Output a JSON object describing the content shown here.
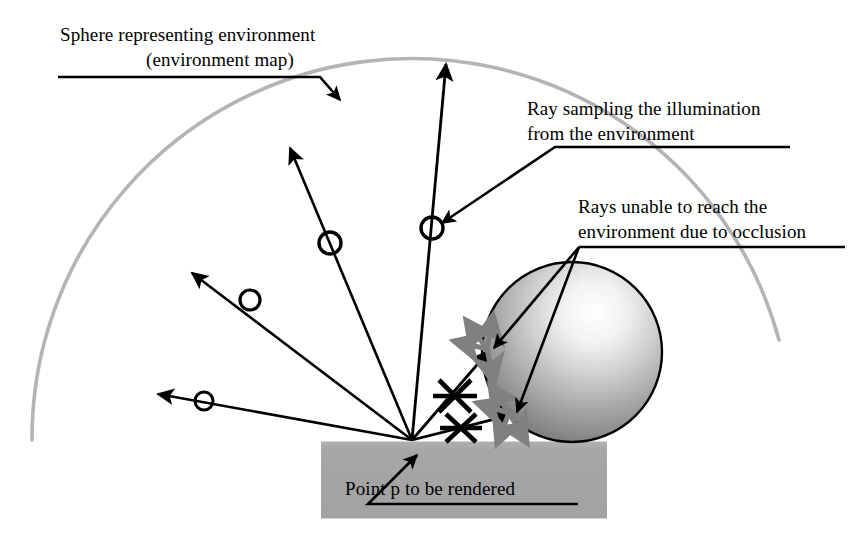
{
  "figure": {
    "background_color": "#ffffff"
  },
  "labels": {
    "sphere_env_line1": "Sphere representing environment",
    "sphere_env_line2": "(environment map)",
    "ray_sampling_line1": "Ray sampling the illumination",
    "ray_sampling_line2": "from the environment",
    "occlusion_line1": "Rays unable to reach the",
    "occlusion_line2": "environment due to occlusion",
    "point_p_prefix": "Point ",
    "point_p_symbol": "p",
    "point_p_suffix": " to be rendered"
  },
  "colors": {
    "ink": "#000000",
    "environment_arc": "#b0b0b0",
    "ground": "#a8a8a8",
    "ground_edge": "#9a9a9a",
    "occluded_arrow": "#808080",
    "sphere_highlight": "#ffffff",
    "sphere_mid": "#b8b8b8",
    "sphere_dark": "#6e6e6e",
    "sphere_outline": "#000000"
  },
  "geometry": {
    "origin_point": {
      "x": 412,
      "y": 440
    },
    "environment_arc": {
      "center_x": 412,
      "center_y": 440,
      "radius": 380,
      "start_angle_deg": 180,
      "end_angle_deg": 15,
      "stroke_width": 3.5
    },
    "occluder_sphere": {
      "cx": 572,
      "cy": 352,
      "r": 90
    },
    "ground": {
      "x": 321,
      "y": 441,
      "width": 286,
      "height": 77
    }
  },
  "sampling_rays": [
    {
      "name": "ray-left-horizontal",
      "tip_x": 152,
      "tip_y": 393,
      "marker_x": 204,
      "marker_y": 401,
      "marker_radius": 9
    },
    {
      "name": "ray-upper-left",
      "tip_x": 186,
      "tip_y": 268,
      "marker_x": 250,
      "marker_y": 300,
      "marker_radius": 10
    },
    {
      "name": "ray-mid-left",
      "tip_x": 286,
      "tip_y": 142,
      "marker_x": 330,
      "marker_y": 243,
      "marker_radius": 11
    },
    {
      "name": "ray-vertical",
      "tip_x": 446,
      "tip_y": 58,
      "marker_x": 432,
      "marker_y": 228,
      "marker_radius": 11
    }
  ],
  "occluded_rays": [
    {
      "name": "occluded-ray-upper",
      "hit_x": 487,
      "hit_y": 349,
      "cross_x": 455,
      "cross_y": 396
    },
    {
      "name": "occluded-ray-lower",
      "hit_x": 509,
      "hit_y": 413,
      "cross_x": 460,
      "cross_y": 428
    }
  ],
  "scatter_arrows_upper": [
    {
      "angle_deg": 255,
      "length": 34
    },
    {
      "angle_deg": 300,
      "length": 36
    },
    {
      "angle_deg": 348,
      "length": 32
    },
    {
      "angle_deg": 60,
      "length": 34
    }
  ],
  "scatter_arrows_lower": [
    {
      "angle_deg": 250,
      "length": 34
    },
    {
      "angle_deg": 298,
      "length": 34
    },
    {
      "angle_deg": 352,
      "length": 30
    },
    {
      "angle_deg": 52,
      "length": 32
    }
  ],
  "leaders": {
    "sphere_env": {
      "x1": 58,
      "y1": 77,
      "x2": 320,
      "y2": 77,
      "x3": 341,
      "y3": 101
    },
    "ray_sampling": {
      "x1": 790,
      "y1": 147,
      "x2": 555,
      "y2": 147,
      "x3": 442,
      "y3": 222
    },
    "occlusion": {
      "x1": 845,
      "y1": 247,
      "x2": 578,
      "y2": 247,
      "hit1_x": 490,
      "hit1_y": 345,
      "hit2_x": 512,
      "hit2_y": 410
    },
    "point_p": {
      "x1": 578,
      "y1": 504,
      "x2": 368,
      "y2": 504,
      "x3": 419,
      "y3": 452
    }
  }
}
